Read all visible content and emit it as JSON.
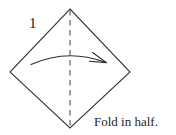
{
  "figure": {
    "type": "origami-fold-diagram",
    "step_number": "1",
    "caption": "Fold in half.",
    "colors": {
      "background": "#ffffff",
      "outline": "#3a3a3a",
      "fold_line": "#555555",
      "arrow": "#2e2e2e",
      "text": "#1c1c1c"
    },
    "shape": {
      "name": "square-rotated-diamond",
      "vertices": [
        {
          "name": "top",
          "x": 70,
          "y": 9
        },
        {
          "name": "right",
          "x": 130,
          "y": 72
        },
        {
          "name": "bottom",
          "x": 70,
          "y": 128
        },
        {
          "name": "left",
          "x": 10,
          "y": 72
        }
      ]
    },
    "fold_line": {
      "name": "vertical-valley-fold",
      "style": "dashed",
      "from": {
        "x": 70,
        "y": 9
      },
      "to": {
        "x": 70,
        "y": 128
      }
    },
    "arrow": {
      "name": "fold-direction-arrow",
      "style": "curved-arc-right",
      "from": {
        "x": 31,
        "y": 64
      },
      "to": {
        "x": 106,
        "y": 62
      }
    }
  }
}
